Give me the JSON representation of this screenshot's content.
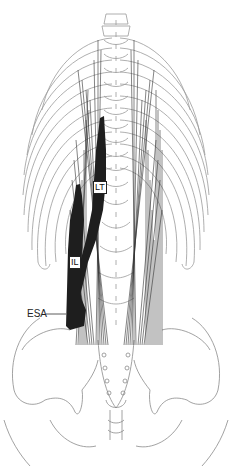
{
  "figure": {
    "labels": [
      {
        "id": "LT",
        "text": "LT"
      },
      {
        "id": "IL",
        "text": "IL"
      },
      {
        "id": "ESA",
        "text": "ESA"
      }
    ],
    "colors": {
      "bone_outline": "#9a9a9a",
      "muscle_fill": "#1e1e1e",
      "muscle_lines": "#333333",
      "background": "#ffffff"
    }
  }
}
